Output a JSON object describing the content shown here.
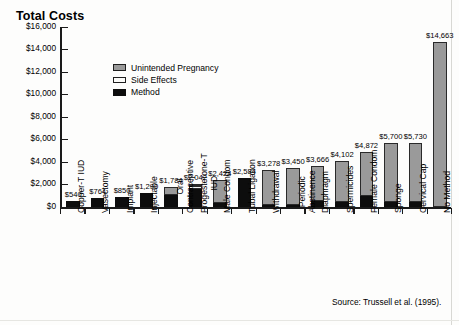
{
  "chart_title": "Total Costs",
  "source_note": "Source: Trussell et al. (1995).",
  "legend": {
    "items": [
      {
        "label": "Unintended Pregnancy",
        "swatch": "gray",
        "color": "#9a9a9a"
      },
      {
        "label": "Side Effects",
        "swatch": "white",
        "color": "#ffffff"
      },
      {
        "label": "Method",
        "swatch": "black",
        "color": "#0d0d0d"
      }
    ]
  },
  "chart_data": {
    "type": "bar",
    "subtype": "stacked-bar",
    "title": "Total Costs",
    "xlabel": "",
    "ylabel": "",
    "ylim": [
      0,
      16000
    ],
    "ytick_labels": [
      "$16,000",
      "$14,000",
      "$12,000",
      "$10,000",
      "$8,000",
      "$6,000",
      "$4,000",
      "$2,000",
      "$0"
    ],
    "ytick_values": [
      16000,
      14000,
      12000,
      10000,
      8000,
      6000,
      4000,
      2000,
      0
    ],
    "grid": false,
    "legend_position": "upper-left-inside",
    "categories": [
      "Copper-T IUD",
      "Vasectomy",
      "Implant",
      "Injectable",
      "Oral Contraceptive",
      "Progesterone-T IUD",
      "Male Condom",
      "Tubal Ligation",
      "Withdrawal",
      "Periodic Abstinence",
      "Diaphragm",
      "Spermicides",
      "Female Condom",
      "Sponge",
      "Cervical Cap",
      "No Method"
    ],
    "category_label_lines": [
      "Copper-T IUD",
      "Vasectomy",
      "Implant",
      "Injectable",
      "Oral\nContraceptive",
      "Progesterone-T\nIUD",
      "Male Condom",
      "Tubal Ligation",
      "Withdrawal",
      "Periodic\nAbstinence",
      "Diaphragm",
      "Spermicides",
      "Female Condom",
      "Sponge",
      "Cervical Cap",
      "No Method"
    ],
    "totals": [
      540,
      764,
      850,
      1290,
      1784,
      2042,
      2424,
      2584,
      3278,
      3450,
      3666,
      4102,
      4872,
      5700,
      5730,
      14663
    ],
    "total_labels": [
      "$540",
      "$764",
      "$850",
      "$1,290",
      "$1,784",
      "$2,042",
      "$2,424",
      "$2,584",
      "$3,278",
      "$3,450",
      "$3,666",
      "$4,102",
      "$4,872",
      "$5,700",
      "$5,730",
      "$14,663"
    ],
    "series": [
      {
        "name": "Method",
        "color": "#0d0d0d",
        "values": [
          540,
          764,
          850,
          1290,
          1030,
          1560,
          330,
          2584,
          90,
          60,
          560,
          430,
          1010,
          420,
          430,
          0
        ]
      },
      {
        "name": "Side Effects",
        "color": "#ffffff",
        "values": [
          0,
          0,
          0,
          0,
          0,
          290,
          0,
          0,
          0,
          0,
          0,
          0,
          0,
          0,
          0,
          0
        ]
      },
      {
        "name": "Unintended Pregnancy",
        "color": "#9a9a9a",
        "values": [
          0,
          0,
          0,
          0,
          754,
          192,
          2094,
          0,
          3188,
          3390,
          3106,
          3672,
          3862,
          5280,
          5300,
          14663
        ]
      }
    ]
  }
}
